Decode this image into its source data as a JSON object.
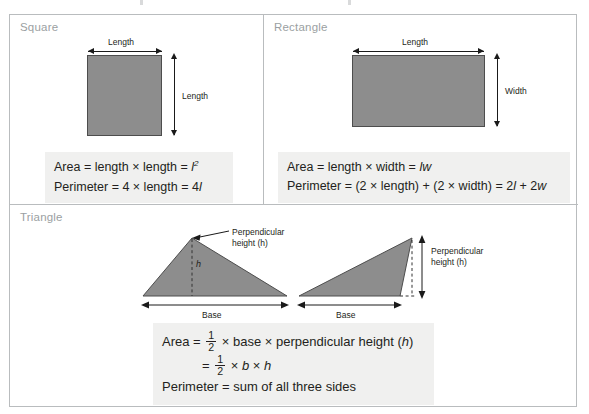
{
  "figure": {
    "panels": [
      {
        "id": "square",
        "title": "Square",
        "shape": "square",
        "labels": {
          "top": "Length",
          "right": "Length"
        },
        "formulas": [
          {
            "parts": [
              "Area = length × length = ",
              "l",
              "2"
            ],
            "type": "power"
          },
          {
            "parts": [
              "Perimeter = 4 × length = 4",
              "l"
            ],
            "type": "plain"
          }
        ],
        "formula_text": [
          "Area = length × length = l2",
          "Perimeter = 4 × length = 4l"
        ]
      },
      {
        "id": "rectangle",
        "title": "Rectangle",
        "shape": "rectangle",
        "labels": {
          "top": "Length",
          "right": "Width"
        },
        "formula_text": [
          "Area = length × width = lw",
          "Perimeter = (2 × length) + (2 × width) = 2l + 2w"
        ],
        "formula_segments": [
          [
            "Area = length × width = ",
            "lw"
          ],
          [
            "Perimeter = (2 × length) + (2 × width) = 2",
            "l",
            " + 2",
            "w"
          ]
        ]
      },
      {
        "id": "triangle",
        "title": "Triangle",
        "diagrams": [
          {
            "id": "acute-triangle",
            "callout": "Perpendicular\nheight (h)",
            "callout_line1": "Perpendicular",
            "callout_line2": "height (h)",
            "height_variable": "h",
            "base_label": "Base"
          },
          {
            "id": "obtuse-triangle",
            "callout_line1": "Perpendicular",
            "callout_line2": "height (h)",
            "base_label": "Base"
          }
        ],
        "formula_text": [
          "Area = 1/2 × base × perpendicular height (h)",
          "= 1/2 × b × h",
          "Perimeter = sum of all three sides"
        ],
        "formula_pieces": {
          "area_prefix": "Area = ",
          "numerator": "1",
          "denominator": "2",
          "area_suffix": "× base × perpendicular height (h)",
          "line2_prefix": "= ",
          "line2_suffix_b": "b",
          "line2_suffix_h": "h",
          "times": "×",
          "perimeter": "Perimeter = sum of all three sides"
        }
      }
    ],
    "colors": {
      "shape_fill": "#8d8d8d",
      "shape_stroke": "#4d4d4d",
      "formula_background": "#f0f0ef",
      "panel_border": "#b9bcbe",
      "title_text": "#9b9fa2",
      "body_text": "#231f20"
    }
  }
}
